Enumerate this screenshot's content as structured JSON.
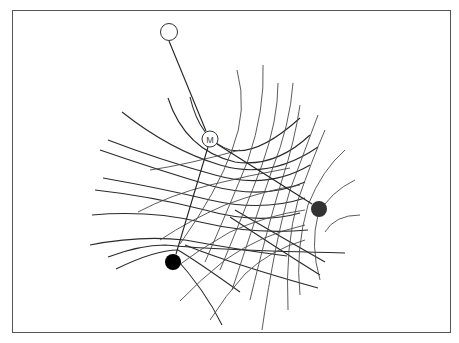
{
  "diagram": {
    "type": "field-line-grid",
    "nodes": [
      {
        "id": "top",
        "kind": "hollow-circle",
        "label": "",
        "cx": 169,
        "cy": 32,
        "r": 8.5
      },
      {
        "id": "M",
        "kind": "hollow-circle",
        "label": "M",
        "cx": 210,
        "cy": 139,
        "r": 8
      },
      {
        "id": "right",
        "kind": "filled-circle",
        "label": "",
        "cx": 319,
        "cy": 209,
        "r": 8,
        "color": "#333333"
      },
      {
        "id": "left",
        "kind": "filled-circle",
        "label": "",
        "cx": 173,
        "cy": 262,
        "r": 8,
        "color": "#000000"
      }
    ],
    "links": [
      {
        "from": "top",
        "to": "M"
      },
      {
        "from": "M",
        "to": "left"
      },
      {
        "from": "M",
        "to": "right"
      }
    ],
    "colors": {
      "frame": "#555555",
      "lines": "#2a2a2a",
      "background": "#ffffff"
    }
  }
}
